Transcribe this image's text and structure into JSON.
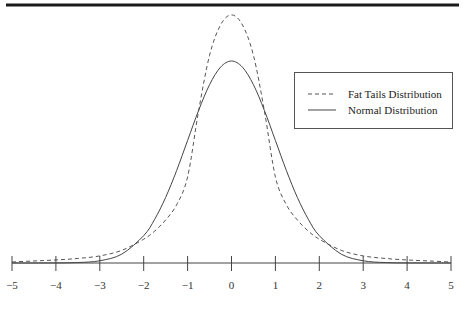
{
  "chart_data": {
    "type": "line",
    "title": "",
    "xlabel": "",
    "ylabel": "",
    "xlim": [
      -5,
      5
    ],
    "ylim": [
      0,
      0.5
    ],
    "grid": false,
    "legend_placement": "top-right",
    "x_ticks": [
      -5,
      -4,
      -3,
      -2,
      -1,
      0,
      1,
      2,
      3,
      4,
      5
    ],
    "x_tick_labels": [
      "−5",
      "−4",
      "−3",
      "−2",
      "−1",
      "0",
      "1",
      "2",
      "3",
      "4",
      "5"
    ],
    "series": [
      {
        "name": "Fat Tails Distribution",
        "style": "dashed",
        "color": "#555555",
        "x": [
          -5,
          -4.5,
          -4,
          -3.5,
          -3,
          -2.5,
          -2,
          -1.75,
          -1.5,
          -1.25,
          -1,
          -0.75,
          -0.5,
          -0.25,
          0,
          0.25,
          0.5,
          0.75,
          1,
          1.25,
          1.5,
          1.75,
          2,
          2.5,
          3,
          3.5,
          4,
          4.5,
          5
        ],
        "y": [
          0.002,
          0.004,
          0.006,
          0.009,
          0.014,
          0.025,
          0.047,
          0.063,
          0.085,
          0.115,
          0.17,
          0.3,
          0.41,
          0.47,
          0.49,
          0.47,
          0.41,
          0.3,
          0.17,
          0.115,
          0.085,
          0.063,
          0.047,
          0.025,
          0.014,
          0.009,
          0.006,
          0.004,
          0.002
        ]
      },
      {
        "name": "Normal Distribution",
        "style": "solid",
        "color": "#444444",
        "x": [
          -5,
          -4.5,
          -4,
          -3.5,
          -3,
          -2.5,
          -2,
          -1.75,
          -1.5,
          -1.25,
          -1,
          -0.75,
          -0.5,
          -0.25,
          0,
          0.25,
          0.5,
          0.75,
          1,
          1.25,
          1.5,
          1.75,
          2,
          2.5,
          3,
          3.5,
          4,
          4.5,
          5
        ],
        "y": [
          1.5e-06,
          1.6e-05,
          0.000134,
          0.000873,
          0.00443,
          0.0175,
          0.054,
          0.0863,
          0.1295,
          0.1826,
          0.242,
          0.3011,
          0.3521,
          0.3867,
          0.3989,
          0.3867,
          0.3521,
          0.3011,
          0.242,
          0.1826,
          0.1295,
          0.0863,
          0.054,
          0.0175,
          0.00443,
          0.000873,
          0.000134,
          1.6e-05,
          1.5e-06
        ]
      }
    ]
  }
}
